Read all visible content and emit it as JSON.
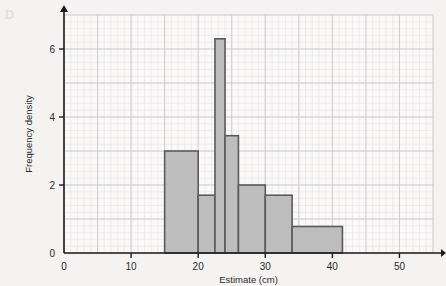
{
  "panel": {
    "letter": "D"
  },
  "chart_data": {
    "type": "bar",
    "title": "",
    "subtitle": "",
    "xlabel": "Estimate (cm)",
    "ylabel": "Frequency density",
    "xlim": [
      0,
      55
    ],
    "ylim": [
      0,
      7
    ],
    "xticks": [
      0,
      10,
      20,
      30,
      40,
      50
    ],
    "xtick_labels": [
      "0",
      "10",
      "20",
      "30",
      "40",
      "50"
    ],
    "yticks": [
      0,
      2,
      4,
      6
    ],
    "ytick_labels": [
      "0",
      "2",
      "4",
      "6"
    ],
    "grid": true,
    "grid_major_step_x": 5,
    "grid_major_step_y": 1,
    "grid_minor_step_x": 1,
    "grid_minor_step_y": 0.2,
    "legend": null,
    "bar_fill_color": "#bdbdbd",
    "bar_edge_color": "#5a5a5a",
    "grid_major_color": "#c9c9cf",
    "grid_minor_color": "#e2e2e8",
    "axis_color": "#1c1c1c",
    "background_color": "#faf9f7",
    "bins": [
      {
        "start": 15,
        "end": 20,
        "density": 3.0
      },
      {
        "start": 20,
        "end": 22.5,
        "density": 1.7
      },
      {
        "start": 22.5,
        "end": 24,
        "density": 6.3
      },
      {
        "start": 24,
        "end": 26,
        "density": 3.45
      },
      {
        "start": 26,
        "end": 30,
        "density": 2.0
      },
      {
        "start": 30,
        "end": 34,
        "density": 1.7
      },
      {
        "start": 34,
        "end": 41.5,
        "density": 0.78
      }
    ],
    "categories": [
      "15-20",
      "20-22.5",
      "22.5-24",
      "24-26",
      "26-30",
      "30-34",
      "34-41.5"
    ],
    "values": [
      3.0,
      1.7,
      6.3,
      3.45,
      2.0,
      1.7,
      0.78
    ]
  }
}
